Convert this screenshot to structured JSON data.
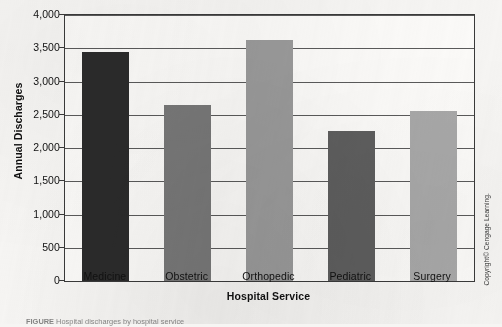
{
  "chart_data": {
    "type": "bar",
    "title": "",
    "xlabel": "Hospital Service",
    "ylabel": "Annual Discharges",
    "categories": [
      "Medicine",
      "Obstetric",
      "Orthopedic",
      "Pediatric",
      "Surgery"
    ],
    "values": [
      3450,
      2640,
      3620,
      2250,
      2560
    ],
    "bar_colors": [
      "#2b2b2b",
      "#787878",
      "#9a9a9a",
      "#5e5e5e",
      "#a8a8a8"
    ],
    "ylim": [
      0,
      4000
    ],
    "ytick_labels": [
      "0",
      "500",
      "1,000",
      "1,500",
      "2,000",
      "2,500",
      "3,000",
      "3,500",
      "4,000"
    ],
    "ytick_values": [
      0,
      500,
      1000,
      1500,
      2000,
      2500,
      3000,
      3500,
      4000
    ],
    "grid": "horizontal",
    "legend": "none"
  },
  "figure": {
    "copyright": "Copyright© Cengage Learning.",
    "caption_label": "FIGURE",
    "caption_text": "   Hospital discharges by hospital service"
  }
}
